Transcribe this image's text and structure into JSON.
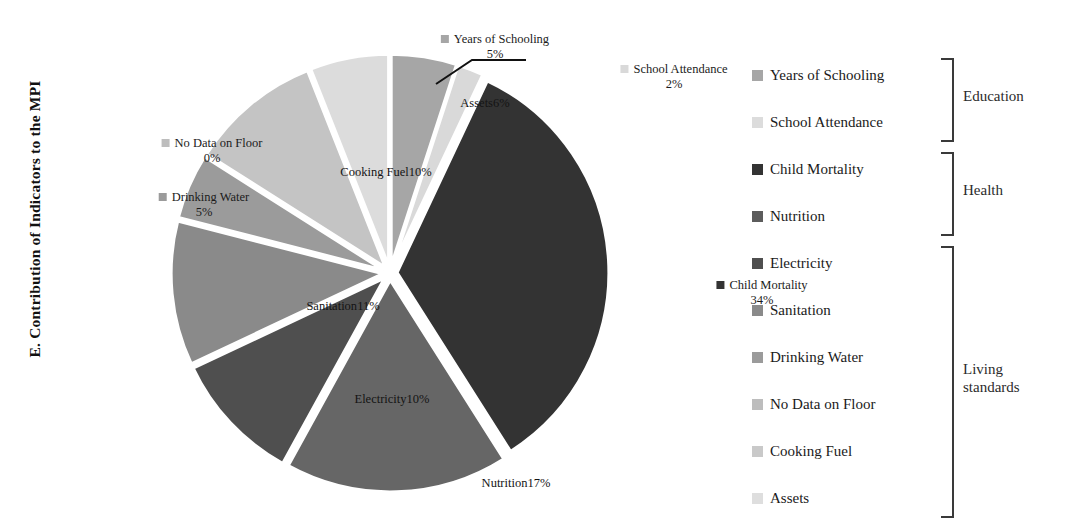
{
  "chart_data": {
    "type": "pie",
    "title": "E. Contribution of Indicators to the MPI",
    "xlabel": "",
    "ylabel": "E. Contribution of Indicators to the MPI",
    "legend_position": "right",
    "grid": false,
    "unit": "%",
    "categories": [
      "Years of Schooling",
      "School Attendance",
      "Child Mortality",
      "Nutrition",
      "Electricity",
      "Sanitation",
      "Drinking Water",
      "No Data on Floor",
      "Cooking Fuel",
      "Assets"
    ],
    "values": [
      5,
      2,
      34,
      17,
      10,
      11,
      5,
      0,
      10,
      6
    ],
    "slices": [
      {
        "label": "Years of Schooling",
        "value": 5,
        "display": "5%",
        "color": "#a6a6a6",
        "group": "Education",
        "label_placement": "outside-top",
        "label_x": 355,
        "label_y": 14,
        "swatch": true
      },
      {
        "label": "School Attendance",
        "value": 2,
        "display": "2%",
        "color": "#d9d9d9",
        "group": "Education",
        "label_placement": "outside-leader",
        "label_x": 534,
        "label_y": 44,
        "swatch": true
      },
      {
        "label": "Child Mortality",
        "value": 34,
        "display": "34%",
        "color": "#333333",
        "group": "Health",
        "label_placement": "outside-right",
        "label_x": 622,
        "label_y": 260,
        "swatch": true
      },
      {
        "label": "Nutrition",
        "value": 17,
        "display": "17%",
        "color": "#666666",
        "group": "Health",
        "label_placement": "inside",
        "label_x": 376,
        "label_y": 458
      },
      {
        "label": "Electricity",
        "value": 10,
        "display": "10%",
        "color": "#4f4f4f",
        "group": "Living standards",
        "label_placement": "inside",
        "label_x": 252,
        "label_y": 374
      },
      {
        "label": "Sanitation",
        "value": 11,
        "display": "11%",
        "color": "#8a8a8a",
        "group": "Living standards",
        "label_placement": "inside",
        "label_x": 203,
        "label_y": 281
      },
      {
        "label": "Drinking Water",
        "value": 5,
        "display": "5%",
        "color": "#9b9b9b",
        "group": "Living standards",
        "label_placement": "outside-left",
        "label_x": 64,
        "label_y": 172,
        "swatch": true
      },
      {
        "label": "No Data on Floor",
        "value": 0,
        "display": "0%",
        "color": "#bdbdbd",
        "group": "Living standards",
        "label_placement": "outside-left",
        "label_x": 72,
        "label_y": 118,
        "swatch": true
      },
      {
        "label": "Cooking Fuel",
        "value": 10,
        "display": "10%",
        "color": "#c4c4c4",
        "group": "Living standards",
        "label_placement": "inside",
        "label_x": 246,
        "label_y": 147
      },
      {
        "label": "Assets",
        "value": 6,
        "display": "6%",
        "color": "#dcdcdc",
        "group": "Living standards",
        "label_placement": "inside",
        "label_x": 345,
        "label_y": 78
      }
    ],
    "legend": [
      {
        "label": "Years of Schooling",
        "color": "#a6a6a6"
      },
      {
        "label": "School Attendance",
        "color": "#dcdcdc"
      },
      {
        "label": "Child Mortality",
        "color": "#333333"
      },
      {
        "label": "Nutrition",
        "color": "#5c5c5c"
      },
      {
        "label": "Electricity",
        "color": "#4f4f4f"
      },
      {
        "label": "Sanitation",
        "color": "#8a8a8a"
      },
      {
        "label": "Drinking Water",
        "color": "#9b9b9b"
      },
      {
        "label": "No Data on Floor",
        "color": "#bdbdbd"
      },
      {
        "label": "Cooking Fuel",
        "color": "#c9c9c9"
      },
      {
        "label": "Assets",
        "color": "#dedede"
      }
    ],
    "groups": [
      {
        "label": "Education",
        "members": [
          "Years of Schooling",
          "School Attendance"
        ]
      },
      {
        "label": "Health",
        "members": [
          "Child Mortality",
          "Nutrition"
        ]
      },
      {
        "label": "Living standards",
        "members": [
          "Electricity",
          "Sanitation",
          "Drinking Water",
          "No Data on Floor",
          "Cooking Fuel",
          "Assets"
        ]
      }
    ]
  },
  "colors": {
    "bracket": "#3a3a3a",
    "leader_line": "#111111",
    "text": "#1a1a1a",
    "background": "#ffffff"
  }
}
